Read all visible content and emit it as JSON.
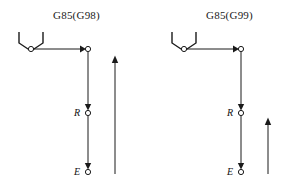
{
  "figure": {
    "type": "diagram",
    "cycle_code": "G85",
    "stroke_color": "#1a1a1a",
    "background_color": "#ffffff",
    "marker_fill": "#ffffff"
  },
  "panels": [
    {
      "id": "g98",
      "title": "G85(G98)",
      "return_mode": "G98",
      "labels": {
        "r_point": "R",
        "e_point": "E"
      },
      "geometry": {
        "tool_x": 31,
        "start_x": 31,
        "start_y": 49,
        "column_x": 88,
        "top_y": 49,
        "r_y": 113,
        "e_y": 172,
        "return_arrow_x": 115,
        "return_arrow_top_y": 55,
        "return_arrow_bottom_y": 174
      }
    },
    {
      "id": "g99",
      "title": "G85(G99)",
      "return_mode": "G99",
      "labels": {
        "r_point": "R",
        "e_point": "E"
      },
      "geometry": {
        "tool_x": 31,
        "start_x": 31,
        "start_y": 49,
        "column_x": 88,
        "top_y": 49,
        "r_y": 113,
        "e_y": 172,
        "return_arrow_x": 115,
        "return_arrow_top_y": 117,
        "return_arrow_bottom_y": 174
      }
    }
  ]
}
